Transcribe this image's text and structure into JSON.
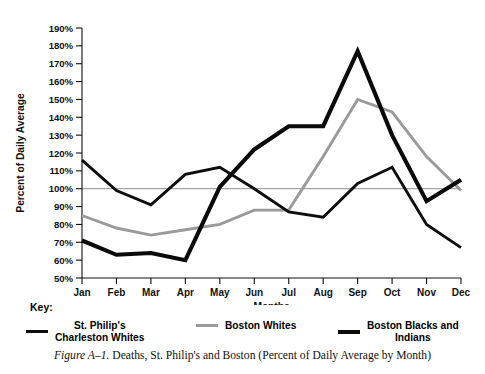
{
  "chart_data": {
    "type": "line",
    "title": "",
    "xlabel": "Months",
    "ylabel": "Percent of Daily Average",
    "categories": [
      "Jan",
      "Feb",
      "Mar",
      "Apr",
      "May",
      "Jun",
      "Jul",
      "Aug",
      "Sep",
      "Oct",
      "Nov",
      "Dec"
    ],
    "ylim": [
      50,
      190
    ],
    "ytick_step": 10,
    "ytick_labels": [
      "190%",
      "180%",
      "170%",
      "160%",
      "150%",
      "140%",
      "130%",
      "120%",
      "110%",
      "100%",
      "90%",
      "80%",
      "70%",
      "60%",
      "50%"
    ],
    "grid": false,
    "reference_line": {
      "value": 100,
      "label": "100%",
      "color": "#8d8d8d"
    },
    "legend_position": "below-plot",
    "series": [
      {
        "name": "St. Philip's Charleston Whites",
        "color": "#0d0d0d",
        "style": "solid-medium",
        "values": [
          116,
          99,
          91,
          108,
          112,
          100,
          87,
          84,
          103,
          112,
          80,
          67
        ]
      },
      {
        "name": "Boston Whites",
        "color": "#9a9a9a",
        "style": "solid-gray",
        "values": [
          85,
          78,
          74,
          77,
          80,
          88,
          88,
          118,
          150,
          143,
          118,
          99
        ]
      },
      {
        "name": "Boston Blacks and Indians",
        "color": "#0a0a0a",
        "style": "solid-thick",
        "values": [
          71,
          63,
          64,
          60,
          101,
          122,
          135,
          135,
          177,
          130,
          93,
          105
        ]
      }
    ]
  },
  "key": {
    "label": "Key:",
    "entries": [
      {
        "swatch": "swatch-a",
        "icon_name": "legend-line-st-philips",
        "text": "St. Philip's\nCharleston Whites"
      },
      {
        "swatch": "swatch-b",
        "icon_name": "legend-line-boston-whites",
        "text": "Boston Whites"
      },
      {
        "swatch": "swatch-c",
        "icon_name": "legend-line-boston-blacks",
        "text": "Boston Blacks and\nIndians"
      }
    ]
  },
  "caption": {
    "figure_number": "Figure A–1.",
    "text": " Deaths, St. Philip's and Boston (Percent of Daily Average by Month)"
  }
}
